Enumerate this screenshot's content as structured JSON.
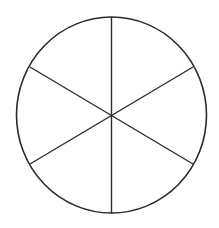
{
  "diagram": {
    "shape": "circle",
    "sectors": 6,
    "stroke_color": "#2b2b2b",
    "background": "#ffffff",
    "center": {
      "x": 111.5,
      "y": 115
    },
    "radius_x": 95,
    "radius_y": 98,
    "spokes": [
      {
        "x1": 111.5,
        "y1": 17,
        "x2": 111.5,
        "y2": 213
      },
      {
        "x1": 30,
        "y1": 67,
        "x2": 193,
        "y2": 164
      },
      {
        "x1": 193,
        "y1": 67,
        "x2": 30,
        "y2": 164
      }
    ]
  }
}
